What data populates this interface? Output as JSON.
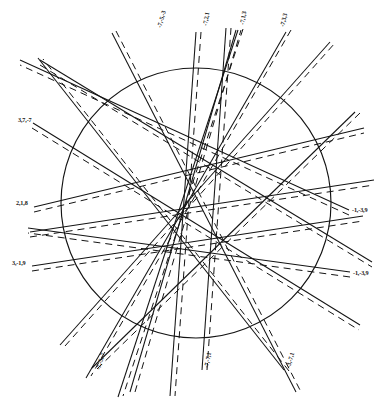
{
  "figure": {
    "type": "line-arrangement",
    "background_color": "#ffffff",
    "ink_color": "#141414",
    "canvas": {
      "width": 388,
      "height": 405
    }
  },
  "circle": {
    "name": "unit-circle",
    "center_x": 196,
    "center_y": 203,
    "radius": 135,
    "stroke_color": "#141414",
    "stroke_width": 1.15,
    "fill": "none"
  },
  "style": {
    "solid_stroke_width": 1.05,
    "dashed_stroke_width": 1.0,
    "dash_pattern": "7 5",
    "pair_offset_px": 4
  },
  "chart_data": {
    "type": "line",
    "xlabel": "",
    "ylabel": "",
    "grid": false,
    "legend": "none",
    "series": [
      {
        "name": "-7,-5,-3",
        "label": "-7,-5,-3",
        "label_x": 161,
        "label_y": 28,
        "label_rotation": -74,
        "label_anchor": "start",
        "x1": 112,
        "y1": 33,
        "x2": 296,
        "y2": 392,
        "offset_x": 4,
        "offset_y": -2
      },
      {
        "name": "-7,2,1",
        "label": "-7,2,1",
        "label_x": 207,
        "label_y": 26,
        "label_rotation": -80,
        "label_anchor": "start",
        "x1": 196,
        "y1": 32,
        "x2": 170,
        "y2": 396,
        "offset_x": 5,
        "offset_y": 0
      },
      {
        "name": "-7,1,3",
        "label": "-7,1,3",
        "label_x": 244,
        "label_y": 25,
        "label_rotation": -80,
        "label_anchor": "start",
        "x1": 238,
        "y1": 30,
        "x2": 118,
        "y2": 397,
        "offset_x": 5,
        "offset_y": -1
      },
      {
        "name": "-7,3,3",
        "label": "-7,3,3",
        "label_x": 284,
        "label_y": 27,
        "label_rotation": -76,
        "label_anchor": "start",
        "x1": 286,
        "y1": 32,
        "x2": 86,
        "y2": 378,
        "offset_x": 5,
        "offset_y": -2
      },
      {
        "name": "3,7,-7",
        "label": "3,7,-7",
        "label_x": 18,
        "label_y": 122,
        "label_rotation": 0,
        "label_anchor": "start",
        "x1": 33,
        "y1": 123,
        "x2": 360,
        "y2": 325,
        "offset_x": -1,
        "offset_y": 5
      },
      {
        "name": "2,1,8",
        "label": "2,1,8",
        "label_x": 16,
        "label_y": 205,
        "label_rotation": 0,
        "label_anchor": "start",
        "x1": 34,
        "y1": 207,
        "x2": 364,
        "y2": 128,
        "offset_x": 0,
        "offset_y": 5
      },
      {
        "name": "3,-1,9",
        "label": "3,-1,9",
        "label_x": 12,
        "label_y": 265,
        "label_rotation": 0,
        "label_anchor": "start",
        "x1": 32,
        "y1": 266,
        "x2": 363,
        "y2": 216,
        "offset_x": 0,
        "offset_y": 5
      },
      {
        "name": "-1,-3,9",
        "label": "-1,-3,9",
        "label_x": 352,
        "label_y": 212,
        "label_rotation": 0,
        "label_anchor": "start",
        "x1": 349,
        "y1": 210,
        "x2": 20,
        "y2": 60,
        "offset_x": 0,
        "offset_y": 5
      },
      {
        "name": "-1,-3,9b",
        "label": "-1,-3,9",
        "label_x": 353,
        "label_y": 275,
        "label_rotation": 0,
        "label_anchor": "start",
        "x1": 350,
        "y1": 272,
        "x2": 28,
        "y2": 228,
        "offset_x": 0,
        "offset_y": 5
      },
      {
        "name": "-7,-5,-7",
        "label": "-7,-5,-7",
        "label_x": 100,
        "label_y": 370,
        "label_rotation": -74,
        "label_anchor": "start",
        "x1": 92,
        "y1": 368,
        "x2": 355,
        "y2": 112,
        "offset_x": 5,
        "offset_y": 1
      },
      {
        "name": "-7,-7,1",
        "label": "-7,-7,1",
        "label_x": 208,
        "label_y": 368,
        "label_rotation": -78,
        "label_anchor": "start",
        "x1": 202,
        "y1": 370,
        "x2": 226,
        "y2": 28,
        "offset_x": 5,
        "offset_y": 0
      },
      {
        "name": "-3,-7,1",
        "label": "-3,-7,1",
        "label_x": 290,
        "label_y": 368,
        "label_rotation": -74,
        "label_anchor": "start",
        "x1": 284,
        "y1": 370,
        "x2": 38,
        "y2": 58,
        "offset_x": 5,
        "offset_y": 1
      }
    ],
    "extra_lines": [
      {
        "name": "aux-1",
        "x1": 40,
        "y1": 60,
        "x2": 372,
        "y2": 262,
        "offset_x": 0,
        "offset_y": 5
      },
      {
        "name": "aux-2",
        "x1": 30,
        "y1": 232,
        "x2": 374,
        "y2": 180,
        "offset_x": 0,
        "offset_y": 5
      },
      {
        "name": "aux-3",
        "x1": 60,
        "y1": 345,
        "x2": 330,
        "y2": 42,
        "offset_x": 5,
        "offset_y": 1
      },
      {
        "name": "aux-4",
        "x1": 130,
        "y1": 392,
        "x2": 236,
        "y2": 30,
        "offset_x": 5,
        "offset_y": 0
      }
    ]
  }
}
